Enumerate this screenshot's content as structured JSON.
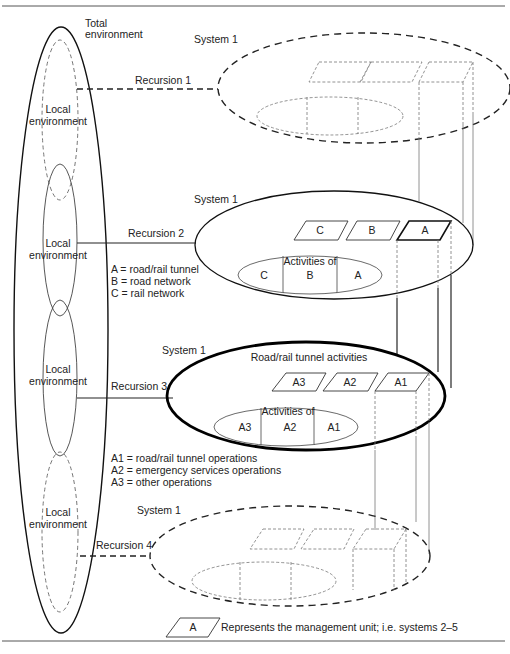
{
  "environment": {
    "total_label_line1": "Total",
    "total_label_line2": "environment",
    "local_label_line1": "Local",
    "local_label_line2": "environment"
  },
  "recursions": [
    {
      "label": "Recursion 1",
      "system_label": "System 1",
      "style": "dashed"
    },
    {
      "label": "Recursion 2",
      "system_label": "System 1",
      "style": "solid"
    },
    {
      "label": "Recursion 3",
      "system_label": "System 1",
      "style": "bold"
    },
    {
      "label": "Recursion 4",
      "system_label": "System 1",
      "style": "dashed"
    }
  ],
  "recursion2": {
    "units": [
      "C",
      "B",
      "A"
    ],
    "activities_title": "Activities of",
    "activities": [
      "C",
      "B",
      "A"
    ],
    "legend": [
      "A = road/rail tunnel",
      "B = road network",
      "C = rail network"
    ]
  },
  "recursion3": {
    "title": "Road/rail tunnel activities",
    "units": [
      "A3",
      "A2",
      "A1"
    ],
    "activities_title": "Activities of",
    "activities": [
      "A3",
      "A2",
      "A1"
    ],
    "legend": [
      "A1 = road/rail tunnel operations",
      "A2 = emergency services operations",
      "A3 = other operations"
    ]
  },
  "key": {
    "symbol_label": "A",
    "description": "Represents the management unit; i.e. systems 2–5"
  }
}
